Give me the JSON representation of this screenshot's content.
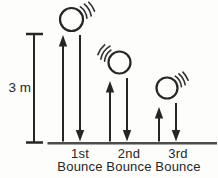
{
  "diagram": {
    "type": "bouncing-ball-height-diagram",
    "height_label": "3 m",
    "bounces": [
      {
        "ordinal": "1st",
        "word": "Bounce"
      },
      {
        "ordinal": "2nd",
        "word": "Bounce"
      },
      {
        "ordinal": "3rd",
        "word": "Bounce"
      }
    ],
    "colors": {
      "ink": "#262626",
      "ground_line": "#4d4d4d",
      "background": "#fdfdfc"
    }
  }
}
